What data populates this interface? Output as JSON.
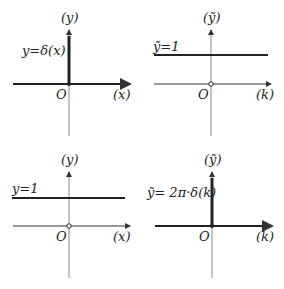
{
  "panels": [
    {
      "id": "top-left",
      "y_axis_label": "(y)",
      "x_axis_label": "(x)",
      "origin_label": "O",
      "function_label": "y=δ(x)",
      "kind": "delta",
      "thick_x_axis": true
    },
    {
      "id": "top-right",
      "y_axis_label": "(ỹ)",
      "x_axis_label": "(k)",
      "origin_label": "O",
      "function_label": "ỹ=1",
      "kind": "constant",
      "value": 1,
      "thick_x_axis": false
    },
    {
      "id": "bottom-left",
      "y_axis_label": "(y)",
      "x_axis_label": "(x)",
      "origin_label": "O",
      "function_label": "y=1",
      "kind": "constant",
      "value": 1,
      "thick_x_axis": false
    },
    {
      "id": "bottom-right",
      "y_axis_label": "(ỹ)",
      "x_axis_label": "(k)",
      "origin_label": "O",
      "function_label": "ỹ= 2π·δ(k)",
      "kind": "delta",
      "thick_x_axis": true
    }
  ]
}
